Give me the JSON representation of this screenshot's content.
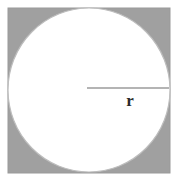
{
  "figure": {
    "background_color": "#ffffff",
    "width": 178,
    "height": 182
  },
  "square": {
    "name": "outer-square",
    "fill_color": "#a0a0a0",
    "stroke_color": "#9a9a9a",
    "x": 8,
    "y": 8,
    "width": 162,
    "height": 165
  },
  "circle": {
    "name": "inscribed-circle",
    "fill_color": "#ffffff",
    "stroke_color": "#bdbdbd",
    "center_x": 89,
    "center_y": 90,
    "radius_x": 81,
    "radius_y": 82
  },
  "radius_line": {
    "name": "radius-segment",
    "stroke_color": "#9b9b9b",
    "x1": 87,
    "y1": 88,
    "x2": 169,
    "y2": 88,
    "stroke_width": 1.4
  },
  "labels": {
    "radius": "r",
    "radius_color": "#2b2b2b"
  }
}
